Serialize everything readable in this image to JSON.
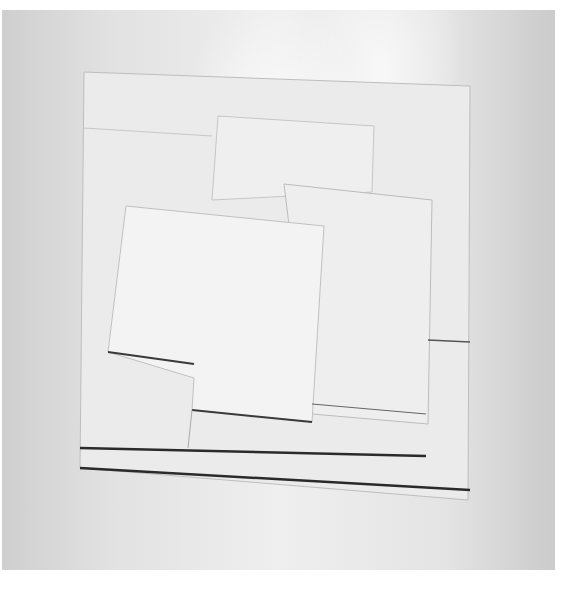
{
  "image": {
    "subject": "white relief artwork of overlapping rectangular panels",
    "colors": {
      "background": "#e4e4e4",
      "panel": "#eeeeee",
      "shadow_line": "#2a2a2a",
      "page": "#ffffff"
    },
    "panels": [
      {
        "name": "base-square",
        "points": "84,76 470,86 468,500 80,466"
      },
      {
        "name": "upper-left-panel",
        "points": "86,128 212,136 208,222 86,222"
      },
      {
        "name": "top-center-panel",
        "points": "218,118 374,126 372,190 210,200"
      },
      {
        "name": "right-panel",
        "points": "284,186 430,200 426,426 312,414"
      },
      {
        "name": "front-panel",
        "points": "124,210 322,226 308,436 192,428 194,378 110,362"
      }
    ]
  }
}
